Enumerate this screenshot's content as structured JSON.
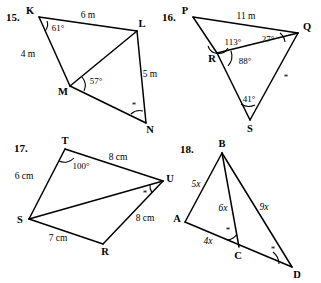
{
  "page": {
    "kind": "geometry-worksheet",
    "background": "#ffffff",
    "ink": "#000000"
  },
  "problems": [
    {
      "number": "15.",
      "vertices": [
        {
          "name": "K",
          "label": "K"
        },
        {
          "name": "L",
          "label": "L"
        },
        {
          "name": "M",
          "label": "M"
        },
        {
          "name": "N",
          "label": "N"
        }
      ],
      "side_labels": [
        {
          "name": "kl-length",
          "text": "6 m"
        },
        {
          "name": "km-length",
          "text": "4 m"
        },
        {
          "name": "ln-length",
          "text": "5 m"
        }
      ],
      "angle_labels": [
        {
          "name": "angle-k",
          "text": "61°"
        },
        {
          "name": "angle-lmn",
          "text": "57°"
        }
      ],
      "tick_labels": [
        {
          "name": "angle-n-tick",
          "text": "*"
        }
      ]
    },
    {
      "number": "16.",
      "vertices": [
        {
          "name": "P",
          "label": "P"
        },
        {
          "name": "Q",
          "label": "Q"
        },
        {
          "name": "R",
          "label": "R"
        },
        {
          "name": "S",
          "label": "S"
        }
      ],
      "side_labels": [
        {
          "name": "pq-length",
          "text": "11 m"
        }
      ],
      "angle_labels": [
        {
          "name": "angle-prq",
          "text": "113°"
        },
        {
          "name": "angle-q",
          "text": "27°"
        },
        {
          "name": "angle-qrs",
          "text": "88°"
        },
        {
          "name": "angle-s",
          "text": "41°"
        }
      ],
      "tick_labels": [
        {
          "name": "angle-qs-tick",
          "text": "*"
        }
      ]
    },
    {
      "number": "17.",
      "vertices": [
        {
          "name": "T",
          "label": "T"
        },
        {
          "name": "U",
          "label": "U"
        },
        {
          "name": "S",
          "label": "S"
        },
        {
          "name": "R",
          "label": "R"
        }
      ],
      "side_labels": [
        {
          "name": "tu-length",
          "text": "8 cm"
        },
        {
          "name": "st-length",
          "text": "6 cm"
        },
        {
          "name": "ru-length",
          "text": "8 cm"
        },
        {
          "name": "sr-length",
          "text": "7 cm"
        }
      ],
      "angle_labels": [
        {
          "name": "angle-t",
          "text": "100°"
        }
      ],
      "tick_labels": [
        {
          "name": "angle-u-tick",
          "text": "*"
        }
      ]
    },
    {
      "number": "18.",
      "vertices": [
        {
          "name": "B",
          "label": "B"
        },
        {
          "name": "A",
          "label": "A"
        },
        {
          "name": "C",
          "label": "C"
        },
        {
          "name": "D",
          "label": "D"
        }
      ],
      "side_labels": [
        {
          "name": "ab-length",
          "text": "5x"
        },
        {
          "name": "bc-length",
          "text": "6x"
        },
        {
          "name": "bd-length",
          "text": "9x"
        },
        {
          "name": "ac-length",
          "text": "4x"
        }
      ],
      "angle_labels": [],
      "tick_labels": [
        {
          "name": "angle-bca-tick",
          "text": "*"
        },
        {
          "name": "angle-d-tick",
          "text": "*"
        }
      ]
    }
  ]
}
